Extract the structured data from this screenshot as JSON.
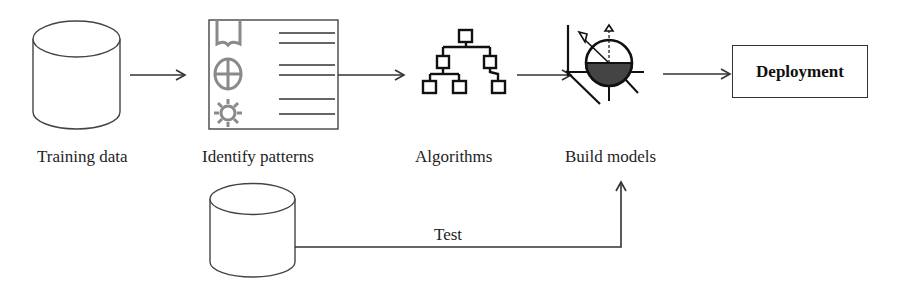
{
  "diagram": {
    "stages": [
      {
        "id": "training-data",
        "label": "Training data",
        "icon": "database-cylinder-icon"
      },
      {
        "id": "identify-patterns",
        "label": "Identify patterns",
        "icon": "pattern-panel-icon"
      },
      {
        "id": "algorithms",
        "label": "Algorithms",
        "icon": "tree-hierarchy-icon"
      },
      {
        "id": "build-models",
        "label": "Build models",
        "icon": "sphere-model-icon"
      },
      {
        "id": "deployment",
        "label": "Deployment",
        "icon": null
      }
    ],
    "test": {
      "label": "Test",
      "icon": "database-cylinder-icon",
      "target": "build-models"
    },
    "flow": [
      [
        "training-data",
        "identify-patterns"
      ],
      [
        "identify-patterns",
        "algorithms"
      ],
      [
        "algorithms",
        "build-models"
      ],
      [
        "build-models",
        "deployment"
      ]
    ],
    "colors": {
      "stroke": "#333333",
      "icon_gray": "#8a8a8a",
      "text": "#1e1e1e"
    }
  }
}
